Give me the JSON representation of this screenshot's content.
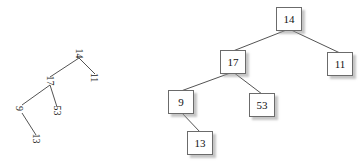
{
  "figure": {
    "title": "",
    "background": "#ffffff",
    "edge_color": "#3f3f3f",
    "node_border_color": "#6b6b6b",
    "node_fill_color": "#ffffff",
    "text_color": "#111111",
    "shadow_color": "#969696"
  },
  "chart_data": {
    "type": "diagram",
    "diagram_kind": "binary-search-tree",
    "title": "",
    "panels": [
      {
        "name": "rotated-tree",
        "rotation_degrees": 90,
        "style": "plain-text-labels",
        "nodes": [
          {
            "id": "L14",
            "label": "14",
            "x": 74,
            "y": 48,
            "parent": null
          },
          {
            "id": "L17",
            "label": "17",
            "x": 45,
            "y": 75,
            "parent": "L14"
          },
          {
            "id": "L11",
            "label": "11",
            "x": 90,
            "y": 72,
            "parent": "L14"
          },
          {
            "id": "L9",
            "label": "9",
            "x": 17,
            "y": 103,
            "parent": "L17"
          },
          {
            "id": "L53",
            "label": "53",
            "x": 52,
            "y": 105,
            "parent": "L17"
          },
          {
            "id": "L13",
            "label": "13",
            "x": 31,
            "y": 133,
            "parent": "L9"
          }
        ],
        "edges": [
          {
            "from": "L14",
            "to": "L17"
          },
          {
            "from": "L14",
            "to": "L11"
          },
          {
            "from": "L17",
            "to": "L9"
          },
          {
            "from": "L17",
            "to": "L53"
          },
          {
            "from": "L9",
            "to": "L13"
          }
        ]
      },
      {
        "name": "upright-tree",
        "rotation_degrees": 0,
        "style": "boxed-nodes",
        "nodes": [
          {
            "id": "R14",
            "label": "14",
            "x": 276,
            "y": 7,
            "parent": null
          },
          {
            "id": "R17",
            "label": "17",
            "x": 220,
            "y": 50,
            "parent": "R14"
          },
          {
            "id": "R11",
            "label": "11",
            "x": 327,
            "y": 52,
            "parent": "R14"
          },
          {
            "id": "R9",
            "label": "9",
            "x": 168,
            "y": 90,
            "parent": "R17"
          },
          {
            "id": "R53",
            "label": "53",
            "x": 249,
            "y": 93,
            "parent": "R17"
          },
          {
            "id": "R13",
            "label": "13",
            "x": 187,
            "y": 131,
            "parent": "R9"
          }
        ],
        "edges": [
          {
            "from": "R14",
            "to": "R17"
          },
          {
            "from": "R14",
            "to": "R11"
          },
          {
            "from": "R17",
            "to": "R9"
          },
          {
            "from": "R17",
            "to": "R53"
          },
          {
            "from": "R9",
            "to": "R13"
          }
        ]
      }
    ],
    "values": [
      14,
      17,
      11,
      9,
      53,
      13
    ],
    "labels": [
      "14",
      "17",
      "11",
      "9",
      "53",
      "13"
    ]
  }
}
